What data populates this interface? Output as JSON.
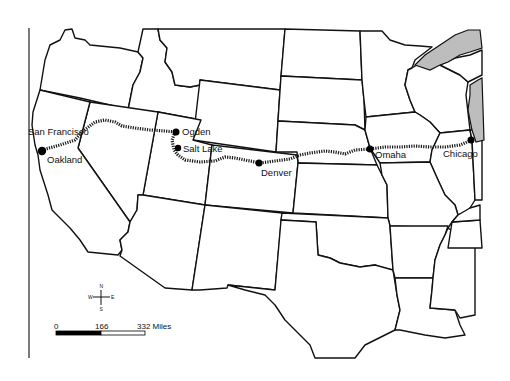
{
  "map": {
    "title": "",
    "route_name": "Transcontinental railroad route",
    "colors": {
      "land": "#ffffff",
      "borders": "#111111",
      "water": "#bdbdbd",
      "route": "#1a1a1a"
    },
    "cities": [
      {
        "id": "san-francisco",
        "label": "San Francisco"
      },
      {
        "id": "oakland",
        "label": "Oakland"
      },
      {
        "id": "ogden",
        "label": "Ogden"
      },
      {
        "id": "salt-lake",
        "label": "Salt Lake"
      },
      {
        "id": "denver",
        "label": "Denver"
      },
      {
        "id": "omaha",
        "label": "Omaha"
      },
      {
        "id": "chicago",
        "label": "Chicago"
      }
    ],
    "compass": {
      "north": "N",
      "south": "S",
      "east": "E",
      "west": "W",
      "icon": "compass-rose-icon"
    },
    "scale_bar": {
      "ticks": [
        "0",
        "166",
        "332 Miles"
      ]
    }
  }
}
